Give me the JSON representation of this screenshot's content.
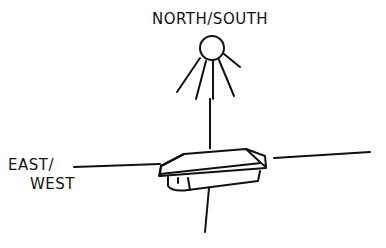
{
  "diagram": {
    "style": "hand-drawn sketch",
    "axes": {
      "vertical": {
        "label": "NORTH/SOUTH",
        "marker_icon": "sun-icon"
      },
      "horizontal": {
        "label_line_1": "EAST/",
        "label_line_2": "WEST"
      }
    },
    "center_object": "flat-box-device"
  },
  "colors": {
    "ink": "#111111",
    "background": "#ffffff"
  }
}
